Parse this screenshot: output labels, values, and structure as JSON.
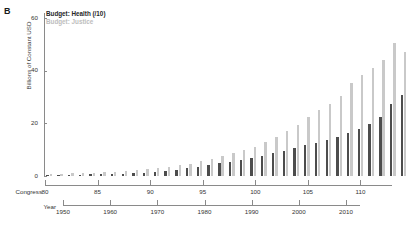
{
  "panel": {
    "label": "B"
  },
  "legend": {
    "position": "top-left-inside",
    "entries": [
      {
        "label": "Budget: Health (/10)",
        "color": "#4d4d4d"
      },
      {
        "label": "Budget: Justice",
        "color": "#c9c9c9"
      }
    ]
  },
  "axes": {
    "y": {
      "label": "Billions of Constant USD",
      "ticks": [
        0,
        20,
        40,
        60
      ],
      "tick_labels": [
        "0",
        "20",
        "40",
        "60"
      ],
      "range": [
        0,
        62
      ]
    },
    "congress": {
      "title": "Congress",
      "ticks": [
        80,
        85,
        90,
        95,
        100,
        105,
        110
      ],
      "tick_labels": [
        "80",
        "85",
        "90",
        "95",
        "100",
        "105",
        "110"
      ],
      "range": [
        80,
        113
      ]
    },
    "year": {
      "title": "Year",
      "ticks": [
        1950,
        1960,
        1970,
        1980,
        1990,
        2000,
        2010
      ],
      "tick_labels": [
        "1950",
        "1960",
        "1970",
        "1980",
        "1990",
        "2000",
        "2010"
      ],
      "range": [
        1947,
        2014
      ]
    }
  },
  "chart_data": {
    "type": "bar",
    "title": "",
    "xlabel": "Congress",
    "ylabel": "Billions of Constant USD",
    "ylim": [
      0,
      62
    ],
    "grid": false,
    "legend_position": "top-left",
    "categories": [
      80,
      81,
      82,
      83,
      84,
      85,
      86,
      87,
      88,
      89,
      90,
      91,
      92,
      93,
      94,
      95,
      96,
      97,
      98,
      99,
      100,
      101,
      102,
      103,
      104,
      105,
      106,
      107,
      108,
      109,
      110,
      111,
      112,
      113
    ],
    "year_labels": [
      1947,
      1949,
      1951,
      1953,
      1955,
      1957,
      1959,
      1961,
      1963,
      1965,
      1967,
      1969,
      1971,
      1973,
      1975,
      1977,
      1979,
      1981,
      1983,
      1985,
      1987,
      1989,
      1991,
      1993,
      1995,
      1997,
      1999,
      2001,
      2003,
      2005,
      2007,
      2009,
      2011,
      2013
    ],
    "series": [
      {
        "name": "Budget: Health (/10)",
        "color": "#4d4d4d",
        "values": [
          0.3,
          0.4,
          0.4,
          0.5,
          0.6,
          0.7,
          0.8,
          0.9,
          1.0,
          1.2,
          1.5,
          1.9,
          2.4,
          3.0,
          3.6,
          4.3,
          5.0,
          5.5,
          6.2,
          7.0,
          7.8,
          8.6,
          9.5,
          10.6,
          11.9,
          12.6,
          13.6,
          15.0,
          16.5,
          18.0,
          19.8,
          22.5,
          27.5,
          31.0
        ]
      },
      {
        "name": "Budget: Justice",
        "color": "#c9c9c9",
        "values": [
          0.8,
          0.9,
          1.0,
          1.1,
          1.3,
          1.5,
          1.7,
          1.9,
          2.2,
          2.5,
          2.9,
          3.4,
          4.0,
          4.7,
          5.6,
          6.6,
          7.7,
          8.6,
          9.8,
          11.2,
          13.0,
          14.8,
          17.0,
          19.5,
          22.5,
          25.0,
          27.5,
          30.5,
          35.5,
          38.5,
          41.0,
          44.0,
          50.5,
          47.0
        ]
      }
    ]
  }
}
